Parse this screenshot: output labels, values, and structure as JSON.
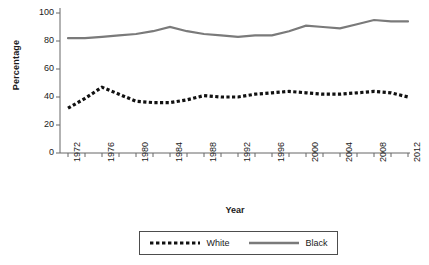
{
  "chart_data": {
    "type": "line",
    "title": "",
    "xlabel": "Year",
    "ylabel": "Percentage",
    "xlim": [
      1972,
      2012
    ],
    "ylim": [
      0,
      100
    ],
    "ytick_values": [
      0,
      20,
      40,
      60,
      80,
      100
    ],
    "ytick_labels": [
      "0",
      "20",
      "40",
      "60",
      "80",
      "100"
    ],
    "xtick_labels": [
      "1972",
      "1976",
      "1980",
      "1984",
      "1988",
      "1992",
      "1996",
      "2000",
      "2004",
      "2008",
      "2012"
    ],
    "xtick_values": [
      1972,
      1976,
      1980,
      1984,
      1988,
      1992,
      1996,
      2000,
      2004,
      2008,
      2012
    ],
    "minor_xtick_interval": 2,
    "grid": false,
    "legend_position": "bottom",
    "x": [
      1972,
      1974,
      1976,
      1978,
      1980,
      1982,
      1984,
      1986,
      1988,
      1990,
      1992,
      1994,
      1996,
      1998,
      2000,
      2002,
      2004,
      2006,
      2008,
      2010,
      2012
    ],
    "series": [
      {
        "name": "White",
        "style": "dotted",
        "color": "#111111",
        "values": [
          32,
          39,
          47,
          42,
          37,
          36,
          36,
          38,
          41,
          40,
          40,
          42,
          43,
          44,
          43,
          42,
          42,
          43,
          44,
          43,
          40
        ]
      },
      {
        "name": "Black",
        "style": "solid",
        "color": "#7a7a7a",
        "values": [
          82,
          82,
          83,
          84,
          85,
          87,
          90,
          87,
          85,
          84,
          83,
          84,
          84,
          87,
          91,
          90,
          89,
          92,
          95,
          94,
          94
        ]
      }
    ]
  },
  "legend": {
    "entries": [
      {
        "label": "White",
        "swatch": "dotted-line-swatch"
      },
      {
        "label": "Black",
        "swatch": "solid-line-swatch"
      }
    ]
  },
  "colors": {
    "white_series": "#111111",
    "black_series": "#7a7a7a",
    "axis": "#666666",
    "text": "#1a1a1a",
    "background": "#ffffff"
  }
}
